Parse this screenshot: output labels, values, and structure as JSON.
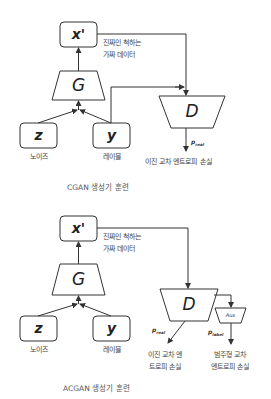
{
  "cgan": {
    "caption": "CGAN 생성기 훈련",
    "nodes": {
      "x_prime": "x'",
      "generator": "G",
      "noise": "z",
      "label": "y",
      "discriminator": "D"
    },
    "labels": {
      "fake_line1": "진짜인 척하는",
      "fake_line2": "가짜 데이터",
      "noise": "노이즈",
      "label": "레이블",
      "loss": "이진 교차 엔트로피 손실"
    },
    "p_real": {
      "p": "p",
      "sub": "real"
    }
  },
  "acgan": {
    "caption": "ACGAN 생성기 훈련",
    "nodes": {
      "x_prime": "x'",
      "generator": "G",
      "noise": "z",
      "label": "y",
      "discriminator": "D",
      "aux": "Aux"
    },
    "labels": {
      "fake_line1": "진짜인 척하는",
      "fake_line2": "가짜 데이터",
      "noise": "노이즈",
      "label": "레이블",
      "bce_line1": "이진 교차 엔",
      "bce_line2": "트로피 손실",
      "cce_line1": "범주형 교차",
      "cce_line2": "엔트로피 손실"
    },
    "p_real": {
      "p": "p",
      "sub": "real"
    },
    "p_label": {
      "p": "p",
      "sub": "label"
    }
  },
  "colors": {
    "stroke": "#333333",
    "background": "#ffffff"
  }
}
